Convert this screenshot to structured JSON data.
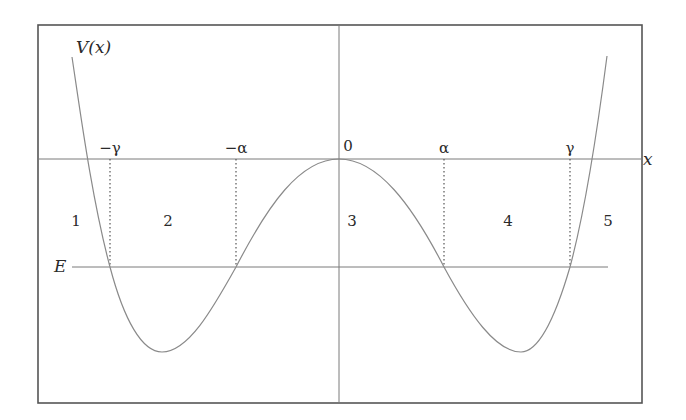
{
  "diagram": {
    "y_axis_label": "V(x)",
    "x_axis_label": "x",
    "energy_label": "E",
    "x_ticks": [
      {
        "label": "−γ",
        "px": 110
      },
      {
        "label": "−α",
        "px": 236
      },
      {
        "label": "0",
        "px": 339
      },
      {
        "label": "α",
        "px": 444
      },
      {
        "label": "γ",
        "px": 570
      }
    ],
    "regions": [
      {
        "label": "1",
        "px": 76
      },
      {
        "label": "2",
        "px": 168
      },
      {
        "label": "3",
        "px": 352
      },
      {
        "label": "4",
        "px": 508
      },
      {
        "label": "5",
        "px": 608
      }
    ],
    "colors": {
      "curve": "#8a8a8a",
      "axes": "#7a7a7a",
      "frame": "#555555",
      "text": "#2a2a2a"
    }
  }
}
